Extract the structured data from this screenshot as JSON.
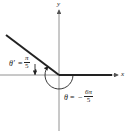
{
  "diagram": {
    "type": "angle-in-standard-position",
    "axes": {
      "x_label": "x",
      "y_label": "y"
    },
    "angle": {
      "symbol": "θ",
      "equals": "=",
      "sign": "−",
      "numerator": "6π",
      "denominator": "5"
    },
    "reference_angle": {
      "symbol": "θ′",
      "equals": "=",
      "numerator": "π",
      "denominator": "5"
    },
    "colors": {
      "line": "#222222",
      "background": "#ffffff"
    }
  }
}
